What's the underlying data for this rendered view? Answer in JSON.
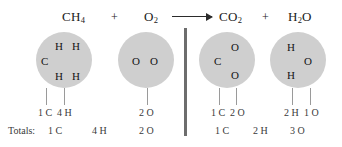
{
  "diagram": {
    "colors": {
      "background": "#ffffff",
      "molecule_fill": "#cfcfcf",
      "atom_text": "#141414",
      "count_text": "#3a3a3a",
      "divider": "#6d6d6d",
      "tick": "#9a9a9a",
      "arrow": "#2b2b2b"
    },
    "equation": {
      "reactant_1": {
        "formula": "CH",
        "subscript": "4"
      },
      "plus_1": "+",
      "reactant_2": {
        "formula": "O",
        "subscript": "2"
      },
      "arrow": "yields-arrow",
      "product_1": {
        "formula": "CO",
        "subscript": "2"
      },
      "plus_2": "+",
      "product_2": {
        "prefix": "H",
        "subscript": "2",
        "suffix": "O"
      }
    },
    "molecules": [
      {
        "name": "methane",
        "atoms": [
          "H",
          "H",
          "C",
          "H",
          "H"
        ],
        "counts": [
          "1 C",
          "4 H"
        ]
      },
      {
        "name": "oxygen",
        "atoms": [
          "O",
          "O"
        ],
        "counts": [
          "2 O"
        ]
      },
      {
        "name": "carbon-dioxide",
        "atoms": [
          "O",
          "C",
          "O"
        ],
        "counts": [
          "1 C",
          "2 O"
        ]
      },
      {
        "name": "water",
        "atoms": [
          "H",
          "O",
          "H"
        ],
        "counts": [
          "2 H",
          "1 O"
        ]
      }
    ],
    "totals": {
      "label": "Totals:",
      "reactants": [
        "1 C",
        "4 H",
        "2 O"
      ],
      "products": [
        "1 C",
        "2 H",
        "3 O"
      ]
    }
  }
}
